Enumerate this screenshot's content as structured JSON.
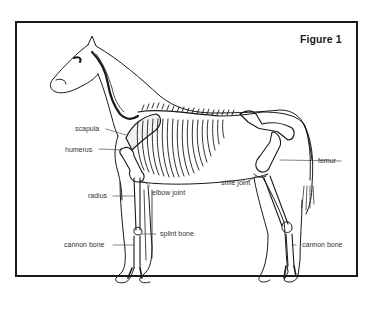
{
  "figure": {
    "title": "Figure 1",
    "labels": {
      "scapula": "scapula",
      "humerus": "humerus",
      "radius": "radius",
      "cannon_bone_front": "cannon bone",
      "elbow_joint": "elbow joint",
      "splint_bone": "splint bone",
      "femur": "femur",
      "stifle_joint": "stifle joint",
      "cannon_bone_hind": "cannon bone"
    }
  },
  "colors": {
    "ink": "#1a1a1a",
    "background": "#ffffff"
  }
}
